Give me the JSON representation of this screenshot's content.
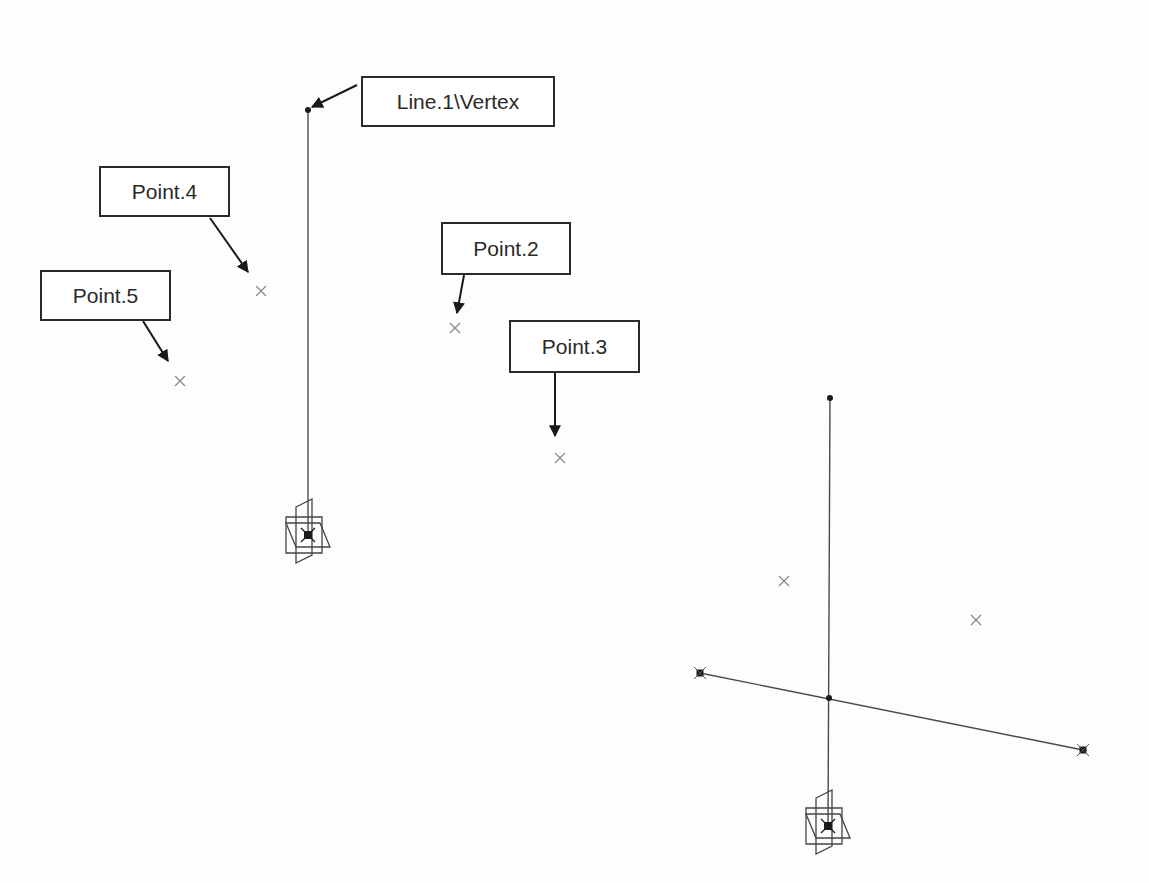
{
  "colors": {
    "ink": "#2a2a2a",
    "point": "#8a8a8a",
    "line": "#4a4a4a"
  },
  "callouts": [
    {
      "label": "Line.1\\Vertex",
      "box": [
        361,
        76,
        194,
        51
      ],
      "arrow": [
        357,
        85,
        310,
        108
      ],
      "target": "line-vertex"
    },
    {
      "label": "Point.4",
      "box": [
        99,
        166,
        131,
        51
      ],
      "arrow": [
        210,
        218,
        248,
        272
      ],
      "target": "point-4"
    },
    {
      "label": "Point.5",
      "box": [
        40,
        270,
        131,
        51
      ],
      "arrow": [
        143,
        321,
        168,
        361
      ],
      "target": "point-5"
    },
    {
      "label": "Point.2",
      "box": [
        441,
        222,
        130,
        53
      ],
      "arrow": [
        464,
        275,
        457,
        313
      ],
      "target": "point-2"
    },
    {
      "label": "Point.3",
      "box": [
        509,
        320,
        131,
        53
      ],
      "arrow": [
        555,
        373,
        555,
        436
      ],
      "target": "point-3"
    }
  ],
  "left_view": {
    "line_top": [
      308,
      110
    ],
    "line_bottom": [
      308,
      535
    ],
    "axis_origin": [
      308,
      535
    ],
    "points": [
      {
        "name": "Point.4",
        "xy": [
          261,
          291
        ]
      },
      {
        "name": "Point.5",
        "xy": [
          180,
          381
        ]
      },
      {
        "name": "Point.2",
        "xy": [
          455,
          328
        ]
      },
      {
        "name": "Point.3",
        "xy": [
          560,
          458
        ]
      }
    ]
  },
  "right_view": {
    "line_top": [
      830,
      398
    ],
    "line_bottom": [
      828,
      826
    ],
    "axis_origin": [
      828,
      826
    ],
    "cross_line": {
      "start": [
        700,
        673
      ],
      "end": [
        1083,
        750
      ],
      "midpoint": [
        829,
        698
      ]
    },
    "points": [
      {
        "xy": [
          784,
          581
        ]
      },
      {
        "xy": [
          976,
          620
        ]
      }
    ]
  }
}
